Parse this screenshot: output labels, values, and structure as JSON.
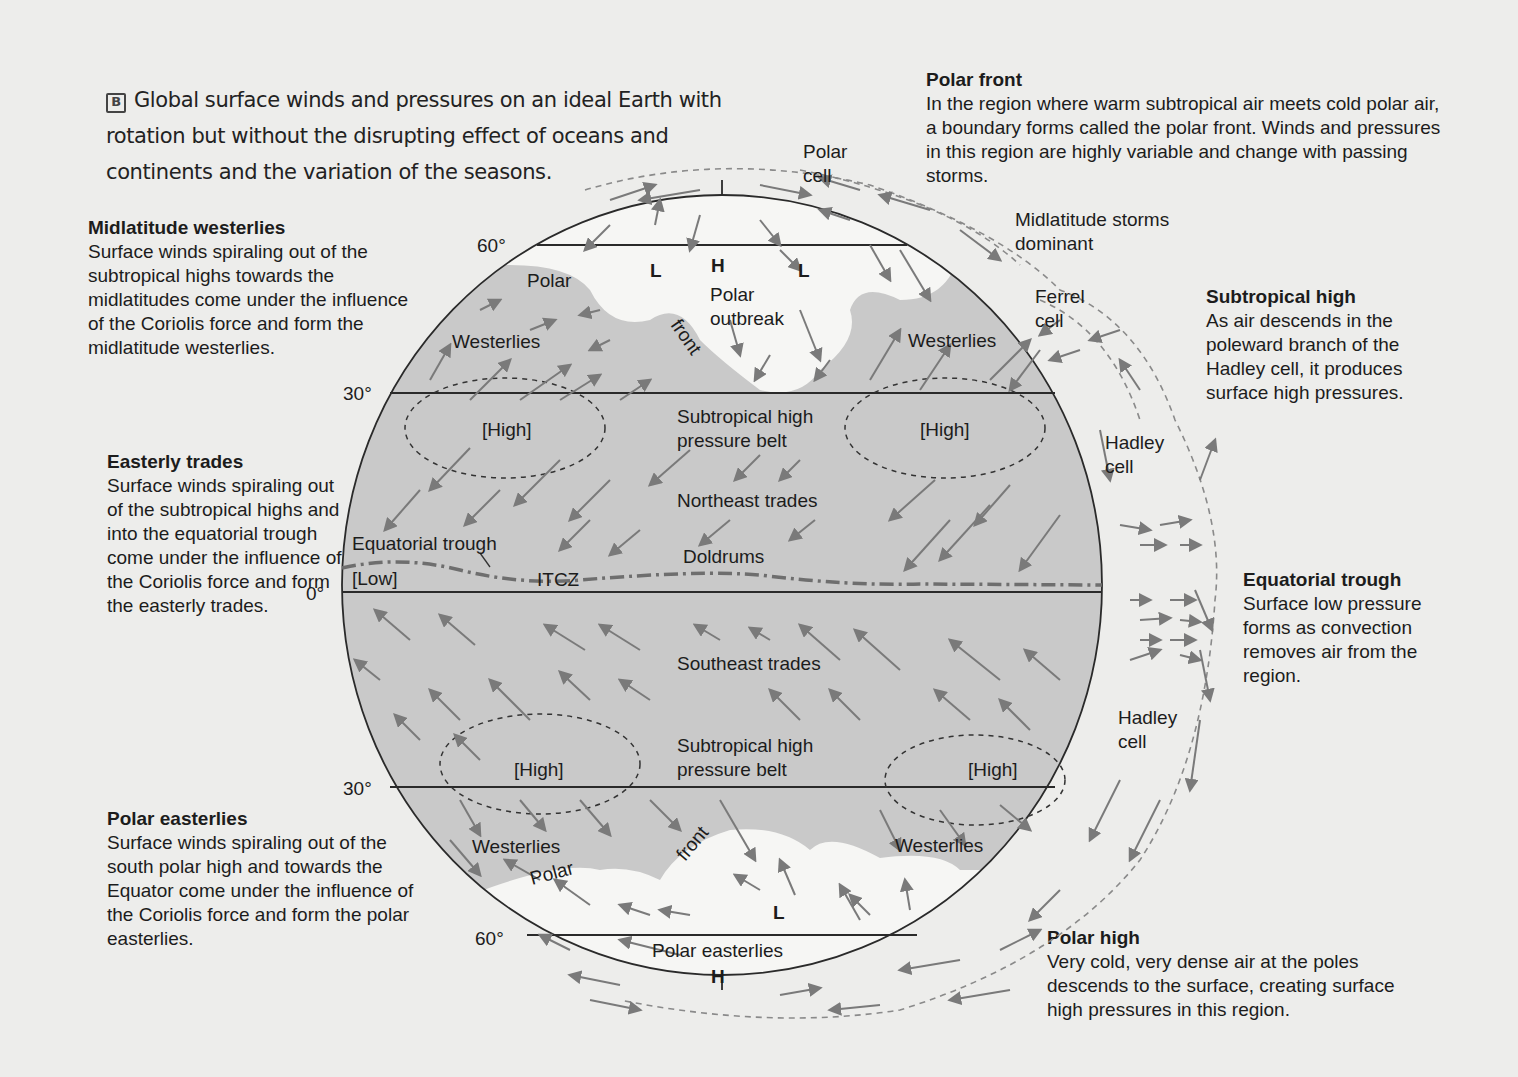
{
  "caption": {
    "tag": "B",
    "text": "Global surface winds and pressures on an ideal Earth with rotation but without the disrupting effect of oceans and continents and the variation of the seasons."
  },
  "notes": {
    "polar_front": {
      "title": "Polar front",
      "body": "In the region where warm subtropical air meets cold polar air, a boundary forms called the polar front. Winds and pressures in this region are highly variable and change with passing storms."
    },
    "midlatitude_westerlies": {
      "title": "Midlatitude westerlies",
      "body": "Surface winds spiraling out of the subtropical highs towards the midlatitudes come under the influence of the Coriolis force and form the midlatitude westerlies."
    },
    "easterly_trades": {
      "title": "Easterly trades",
      "body": "Surface winds spiraling out of the subtropical highs and into the equatorial trough come under the influence of the Coriolis force and form the easterly trades."
    },
    "polar_easterlies": {
      "title": "Polar easterlies",
      "body": "Surface winds spiraling out of the south polar high and towards the Equator come under the influence of the Coriolis force and form the polar easterlies."
    },
    "subtropical_high": {
      "title": "Subtropical high",
      "body": "As air descends in the poleward branch of the Hadley cell, it produces surface high pressures."
    },
    "equatorial_trough": {
      "title": "Equatorial trough",
      "body": "Surface low pressure forms as convection removes air from the region."
    },
    "polar_high": {
      "title": "Polar high",
      "body": "Very cold, very dense air at the poles descends to the surface, creating surface high pressures in this region."
    }
  },
  "latitudes": {
    "n60": "60°",
    "n30": "30°",
    "eq": "0°",
    "s30": "30°",
    "s60": "60°"
  },
  "globe_labels": {
    "polar_cell": "Polar cell",
    "polar_cell_1": "Polar",
    "polar_cell_2": "cell",
    "storms_1": "Midlatitude storms",
    "storms_2": "dominant",
    "ferrel_1": "Ferrel",
    "ferrel_2": "cell",
    "hadley_n_1": "Hadley",
    "hadley_n_2": "cell",
    "hadley_s_1": "Hadley",
    "hadley_s_2": "cell",
    "north_L1": "L",
    "north_H": "H",
    "north_L2": "L",
    "polar_n": "Polar",
    "front_n": "front",
    "polar_outbreak_1": "Polar",
    "polar_outbreak_2": "outbreak",
    "westerlies_nw": "Westerlies",
    "westerlies_ne": "Westerlies",
    "high_nw": "[High]",
    "high_ne": "[High]",
    "stp_belt_n_1": "Subtropical high",
    "stp_belt_n_2": "pressure belt",
    "northeast_trades": "Northeast trades",
    "equatorial_trough": "Equatorial trough",
    "doldrums": "Doldrums",
    "low": "[Low]",
    "itcz": "ITCZ",
    "southeast_trades": "Southeast trades",
    "stp_belt_s_1": "Subtropical high",
    "stp_belt_s_2": "pressure belt",
    "high_sw": "[High]",
    "high_se": "[High]",
    "westerlies_sw": "Westerlies",
    "westerlies_se": "Westerlies",
    "polar_s": "Polar",
    "front_s": "front",
    "south_L": "L",
    "polar_easterlies": "Polar easterlies",
    "south_H": "H"
  },
  "colors": {
    "background": "#ededeb",
    "belt_gray": "#c9c9c9",
    "polar_white": "#f6f6f4",
    "arrow": "#7a7a7a",
    "line": "#2a2a2a"
  }
}
